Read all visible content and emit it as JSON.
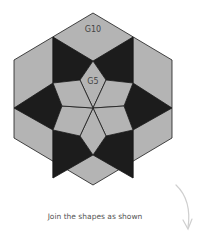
{
  "diagram": {
    "labels": {
      "outer": "G10",
      "inner": "G5"
    },
    "caption": "Join the shapes as shown",
    "colors": {
      "light": "#b4b4b4",
      "dark": "#1c1c1c",
      "stroke": "#1a1a1a",
      "arrow": "#cfcfcf"
    }
  }
}
